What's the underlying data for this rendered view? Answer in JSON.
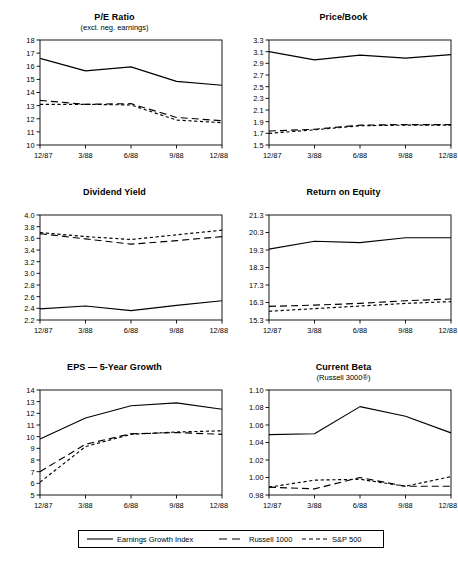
{
  "figure": {
    "categories": [
      "12/87",
      "3/88",
      "6/88",
      "9/88",
      "12/88"
    ],
    "legend": {
      "items": [
        {
          "label": "Earnings Growth Index",
          "style": "solid",
          "icon": "solid-line-swatch"
        },
        {
          "label": "Russell 1000",
          "style": "long-dash",
          "icon": "long-dash-line-swatch"
        },
        {
          "label": "S&P 500",
          "style": "short-dash",
          "icon": "short-dash-line-swatch"
        }
      ]
    },
    "caption": ""
  },
  "chart_data": [
    {
      "type": "line",
      "title": "P/E Ratio",
      "subtitle": "(excl. neg. earnings)",
      "xlabel": "",
      "ylabel": "",
      "x": [
        "12/87",
        "3/88",
        "6/88",
        "9/88",
        "12/88"
      ],
      "ylim": [
        10,
        18
      ],
      "yticks": [
        10,
        11,
        12,
        13,
        14,
        15,
        16,
        17,
        18
      ],
      "ytick_labels": [
        "10",
        "11",
        "12",
        "13",
        "14",
        "15",
        "16",
        "17",
        "18"
      ],
      "grid": false,
      "legend_position": "figure-bottom",
      "series": [
        {
          "name": "Earnings Growth Index",
          "style": "solid",
          "values": [
            16.6,
            15.65,
            15.95,
            14.85,
            14.55
          ]
        },
        {
          "name": "Russell 1000",
          "style": "long-dash",
          "values": [
            13.4,
            13.1,
            13.15,
            12.1,
            11.85
          ]
        },
        {
          "name": "S&P 500",
          "style": "short-dash",
          "values": [
            13.1,
            13.1,
            13.05,
            11.9,
            11.7
          ]
        }
      ]
    },
    {
      "type": "line",
      "title": "Price/Book",
      "subtitle": "",
      "xlabel": "",
      "ylabel": "",
      "x": [
        "12/87",
        "3/88",
        "6/88",
        "9/88",
        "12/88"
      ],
      "ylim": [
        1.5,
        3.3
      ],
      "yticks": [
        1.5,
        1.7,
        1.9,
        2.1,
        2.3,
        2.5,
        2.7,
        2.9,
        3.1,
        3.3
      ],
      "ytick_labels": [
        "1.5",
        "1.7",
        "1.9",
        "2.1",
        "2.3",
        "2.5",
        "2.7",
        "2.9",
        "3.1",
        "3.3"
      ],
      "grid": false,
      "legend_position": "figure-bottom",
      "series": [
        {
          "name": "Earnings Growth Index",
          "style": "solid",
          "values": [
            3.1,
            2.96,
            3.04,
            2.99,
            3.05
          ]
        },
        {
          "name": "Russell 1000",
          "style": "long-dash",
          "values": [
            1.74,
            1.77,
            1.84,
            1.85,
            1.85
          ]
        },
        {
          "name": "S&P 500",
          "style": "short-dash",
          "values": [
            1.7,
            1.76,
            1.83,
            1.84,
            1.84
          ]
        }
      ]
    },
    {
      "type": "line",
      "title": "Dividend Yield",
      "subtitle": "",
      "xlabel": "",
      "ylabel": "",
      "x": [
        "12/87",
        "3/88",
        "6/88",
        "9/88",
        "12/88"
      ],
      "ylim": [
        2.2,
        4.0
      ],
      "yticks": [
        2.2,
        2.4,
        2.6,
        2.8,
        3.0,
        3.2,
        3.4,
        3.6,
        3.8,
        4.0
      ],
      "ytick_labels": [
        "2.2",
        "2.4",
        "2.6",
        "2.8",
        "3.0",
        "3.2",
        "3.4",
        "3.6",
        "3.8",
        "4.0"
      ],
      "grid": false,
      "legend_position": "figure-bottom",
      "series": [
        {
          "name": "Earnings Growth Index",
          "style": "solid",
          "values": [
            2.39,
            2.44,
            2.36,
            2.45,
            2.53
          ]
        },
        {
          "name": "Russell 1000",
          "style": "long-dash",
          "values": [
            3.68,
            3.59,
            3.5,
            3.56,
            3.63
          ]
        },
        {
          "name": "S&P 500",
          "style": "short-dash",
          "values": [
            3.7,
            3.63,
            3.58,
            3.66,
            3.74
          ]
        }
      ]
    },
    {
      "type": "line",
      "title": "Return on Equity",
      "subtitle": "",
      "xlabel": "",
      "ylabel": "",
      "x": [
        "12/87",
        "3/88",
        "6/88",
        "9/88",
        "12/88"
      ],
      "ylim": [
        15.3,
        21.3
      ],
      "yticks": [
        15.3,
        16.3,
        17.3,
        18.3,
        19.3,
        20.3,
        21.3
      ],
      "ytick_labels": [
        "15.3",
        "16.3",
        "17.3",
        "18.3",
        "19.3",
        "20.3",
        "21.3"
      ],
      "grid": false,
      "legend_position": "figure-bottom",
      "series": [
        {
          "name": "Earnings Growth Index",
          "style": "solid",
          "values": [
            19.35,
            19.8,
            19.72,
            20.0,
            20.0
          ]
        },
        {
          "name": "Russell 1000",
          "style": "long-dash",
          "values": [
            16.08,
            16.15,
            16.25,
            16.4,
            16.5
          ]
        },
        {
          "name": "S&P 500",
          "style": "short-dash",
          "values": [
            15.8,
            15.95,
            16.1,
            16.25,
            16.35
          ]
        }
      ]
    },
    {
      "type": "line",
      "title": "EPS — 5-Year Growth",
      "subtitle": "",
      "xlabel": "",
      "ylabel": "",
      "x": [
        "12/87",
        "3/88",
        "6/88",
        "9/88",
        "12/88"
      ],
      "ylim": [
        5,
        14
      ],
      "yticks": [
        5,
        6,
        7,
        8,
        9,
        10,
        11,
        12,
        13,
        14
      ],
      "ytick_labels": [
        "5",
        "6",
        "7",
        "8",
        "9",
        "10",
        "11",
        "12",
        "13",
        "14"
      ],
      "grid": false,
      "legend_position": "figure-bottom",
      "series": [
        {
          "name": "Earnings Growth Index",
          "style": "solid",
          "values": [
            9.8,
            11.6,
            12.65,
            12.9,
            12.35
          ]
        },
        {
          "name": "Russell 1000",
          "style": "long-dash",
          "values": [
            7.0,
            9.35,
            10.25,
            10.35,
            10.2
          ]
        },
        {
          "name": "S&P 500",
          "style": "short-dash",
          "values": [
            6.1,
            9.15,
            10.2,
            10.4,
            10.5
          ]
        }
      ]
    },
    {
      "type": "line",
      "title": "Current Beta",
      "subtitle": "(Russell 3000®)",
      "xlabel": "",
      "ylabel": "",
      "x": [
        "12/87",
        "3/88",
        "6/88",
        "9/88",
        "12/88"
      ],
      "ylim": [
        0.98,
        1.1
      ],
      "yticks": [
        0.98,
        1.0,
        1.02,
        1.04,
        1.06,
        1.08,
        1.1
      ],
      "ytick_labels": [
        "0.98",
        "1.00",
        "1.02",
        "1.04",
        "1.06",
        "1.08",
        "1.10"
      ],
      "grid": false,
      "legend_position": "figure-bottom",
      "series": [
        {
          "name": "Earnings Growth Index",
          "style": "solid",
          "values": [
            1.049,
            1.05,
            1.081,
            1.07,
            1.051
          ]
        },
        {
          "name": "Russell 1000",
          "style": "long-dash",
          "values": [
            0.989,
            0.987,
            1.0,
            0.99,
            0.99
          ]
        },
        {
          "name": "S&P 500",
          "style": "short-dash",
          "values": [
            0.989,
            0.997,
            0.998,
            0.99,
            1.001
          ]
        }
      ]
    }
  ]
}
